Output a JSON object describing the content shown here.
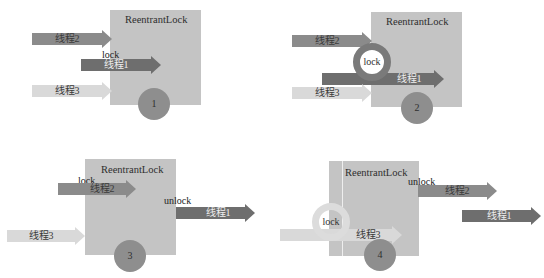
{
  "colors": {
    "box": "#c4c4c4",
    "thread_dark": "#6e6e6e",
    "thread_mid": "#8b8b8b",
    "thread_light": "#d9d9d9",
    "badge": "#8e8e8e",
    "ring_dark": "#7a7a7a",
    "ring_light": "#dcdcdc"
  },
  "panels": [
    {
      "step": "1",
      "box_title": "ReentrantLock",
      "threads": [
        {
          "label": "线程2"
        },
        {
          "label": "线程1",
          "tag": "lock"
        },
        {
          "label": "线程3"
        }
      ]
    },
    {
      "step": "2",
      "box_title": "ReentrantLock",
      "ring_label": "lock",
      "threads": [
        {
          "label": "线程2"
        },
        {
          "label": "线程1"
        },
        {
          "label": "线程3"
        }
      ]
    },
    {
      "step": "3",
      "box_title": "ReentrantLock",
      "threads": [
        {
          "label": "线程2",
          "tag": "lock"
        },
        {
          "label": "线程1",
          "tag": "unlock"
        },
        {
          "label": "线程3"
        }
      ]
    },
    {
      "step": "4",
      "box_title": "ReentrantLock",
      "ring_label": "lock",
      "threads": [
        {
          "label": "线程2",
          "tag": "unlock"
        },
        {
          "label": "线程1"
        },
        {
          "label": "线程3"
        }
      ]
    }
  ]
}
